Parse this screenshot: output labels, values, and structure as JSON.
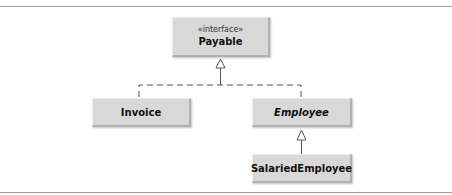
{
  "diagram": {
    "type": "UML class diagram",
    "nodes": [
      {
        "id": "payable",
        "stereotype": "«interface»",
        "name": "Payable",
        "italic": false
      },
      {
        "id": "invoice",
        "name": "Invoice",
        "italic": false
      },
      {
        "id": "employee",
        "name": "Employee",
        "italic": true
      },
      {
        "id": "salaried",
        "name": "SalariedEmployee",
        "italic": false
      }
    ],
    "edges": [
      {
        "from": "Invoice",
        "to": "Payable",
        "kind": "realization",
        "style": "dashed"
      },
      {
        "from": "Employee",
        "to": "Payable",
        "kind": "realization",
        "style": "dashed"
      },
      {
        "from": "SalariedEmployee",
        "to": "Employee",
        "kind": "generalization",
        "style": "solid"
      }
    ]
  },
  "colors": {
    "box_fill": "#d8d8d8",
    "line": "#555555",
    "rule": "#9a9a9a"
  }
}
